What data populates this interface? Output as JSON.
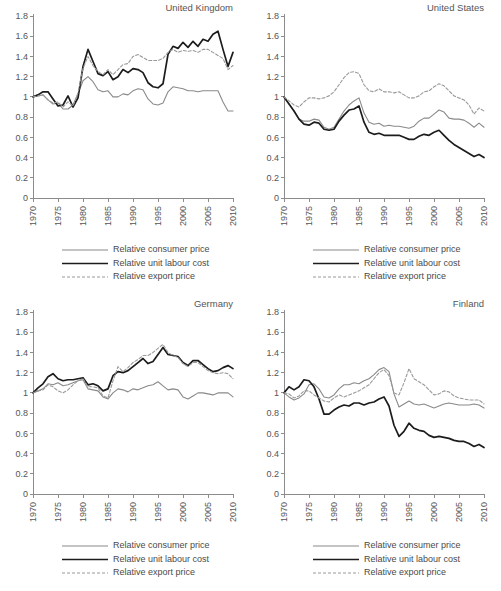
{
  "figure": {
    "panel_titles": [
      "United Kingdom",
      "United States",
      "Germany",
      "Finland"
    ]
  },
  "legend": {
    "items": [
      {
        "label": "Relative consumer price",
        "key": "consumer_price",
        "style": "solid",
        "color": "#8a8a8a",
        "width": 1.1
      },
      {
        "label": "Relative unit labour cost",
        "key": "unit_labour_cost",
        "style": "solid",
        "color": "#1c1c1c",
        "width": 1.7
      },
      {
        "label": "Relative export price",
        "key": "export_price",
        "style": "dashed",
        "color": "#9a9a9a",
        "width": 1.1
      }
    ]
  },
  "axes": {
    "ytick_labels": [
      "1.8",
      "1.6",
      "1.4",
      "1.2",
      "1",
      "0.8",
      "0.6",
      "0.4",
      "0.2",
      "0"
    ],
    "ytick_values": [
      1.8,
      1.6,
      1.4,
      1.2,
      1.0,
      0.8,
      0.6,
      0.4,
      0.2,
      0
    ],
    "xtick_labels": [
      "1970",
      "1975",
      "1980",
      "1985",
      "1990",
      "1995",
      "2000",
      "2005",
      "2010"
    ],
    "xtick_values": [
      1970,
      1975,
      1980,
      1985,
      1990,
      1995,
      2000,
      2005,
      2010
    ],
    "ylim": [
      0,
      1.8
    ],
    "xlim": [
      1970,
      2010
    ],
    "grid": false
  },
  "chart_data": [
    {
      "type": "line",
      "title": "United Kingdom",
      "xlabel": "",
      "ylabel": "",
      "xlim": [
        1970,
        2010
      ],
      "ylim": [
        0,
        1.8
      ],
      "grid": false,
      "legend_position": "below",
      "x": [
        1970,
        1971,
        1972,
        1973,
        1974,
        1975,
        1976,
        1977,
        1978,
        1979,
        1980,
        1981,
        1982,
        1983,
        1984,
        1985,
        1986,
        1987,
        1988,
        1989,
        1990,
        1991,
        1992,
        1993,
        1994,
        1995,
        1996,
        1997,
        1998,
        1999,
        2000,
        2001,
        2002,
        2003,
        2004,
        2005,
        2006,
        2007,
        2008,
        2009,
        2010
      ],
      "series": [
        {
          "name": "Relative consumer price",
          "key": "consumer_price",
          "values": [
            1.0,
            1.01,
            1.02,
            0.97,
            0.93,
            0.94,
            0.88,
            0.88,
            0.92,
            1.03,
            1.16,
            1.2,
            1.15,
            1.07,
            1.05,
            1.06,
            1.0,
            1.0,
            1.03,
            1.02,
            1.06,
            1.08,
            1.07,
            0.98,
            0.93,
            0.92,
            0.94,
            1.05,
            1.1,
            1.09,
            1.08,
            1.06,
            1.06,
            1.05,
            1.06,
            1.06,
            1.06,
            1.06,
            0.95,
            0.86,
            0.86
          ]
        },
        {
          "name": "Relative unit labour cost",
          "key": "unit_labour_cost",
          "values": [
            1.0,
            1.02,
            1.05,
            1.05,
            0.98,
            0.91,
            0.92,
            1.01,
            0.9,
            0.99,
            1.3,
            1.47,
            1.35,
            1.23,
            1.21,
            1.25,
            1.17,
            1.2,
            1.27,
            1.24,
            1.28,
            1.27,
            1.24,
            1.14,
            1.1,
            1.09,
            1.13,
            1.42,
            1.5,
            1.48,
            1.54,
            1.49,
            1.55,
            1.5,
            1.57,
            1.55,
            1.62,
            1.65,
            1.47,
            1.3,
            1.44
          ]
        },
        {
          "name": "Relative export price",
          "key": "export_price",
          "values": [
            1.0,
            1.01,
            1.02,
            0.97,
            0.94,
            0.95,
            0.9,
            0.95,
            0.91,
            1.04,
            1.28,
            1.4,
            1.31,
            1.25,
            1.22,
            1.27,
            1.22,
            1.27,
            1.32,
            1.33,
            1.4,
            1.42,
            1.39,
            1.36,
            1.36,
            1.36,
            1.38,
            1.44,
            1.47,
            1.44,
            1.46,
            1.45,
            1.46,
            1.44,
            1.47,
            1.47,
            1.44,
            1.41,
            1.38,
            1.27,
            1.31
          ]
        }
      ]
    },
    {
      "type": "line",
      "title": "United States",
      "xlabel": "",
      "ylabel": "",
      "xlim": [
        1970,
        2010
      ],
      "ylim": [
        0,
        1.8
      ],
      "grid": false,
      "legend_position": "below",
      "x": [
        1970,
        1971,
        1972,
        1973,
        1974,
        1975,
        1976,
        1977,
        1978,
        1979,
        1980,
        1981,
        1982,
        1983,
        1984,
        1985,
        1986,
        1987,
        1988,
        1989,
        1990,
        1991,
        1992,
        1993,
        1994,
        1995,
        1996,
        1997,
        1998,
        1999,
        2000,
        2001,
        2002,
        2003,
        2004,
        2005,
        2006,
        2007,
        2008,
        2009,
        2010
      ],
      "series": [
        {
          "name": "Relative consumer price",
          "key": "consumer_price",
          "values": [
            1.0,
            0.93,
            0.86,
            0.78,
            0.76,
            0.76,
            0.78,
            0.77,
            0.7,
            0.68,
            0.7,
            0.78,
            0.86,
            0.92,
            0.96,
            0.99,
            0.84,
            0.75,
            0.73,
            0.74,
            0.71,
            0.72,
            0.71,
            0.71,
            0.7,
            0.69,
            0.71,
            0.76,
            0.79,
            0.79,
            0.83,
            0.87,
            0.85,
            0.79,
            0.78,
            0.78,
            0.77,
            0.74,
            0.7,
            0.74,
            0.7
          ]
        },
        {
          "name": "Relative unit labour cost",
          "key": "unit_labour_cost",
          "values": [
            1.0,
            0.93,
            0.86,
            0.78,
            0.73,
            0.72,
            0.75,
            0.74,
            0.68,
            0.67,
            0.68,
            0.76,
            0.82,
            0.87,
            0.88,
            0.91,
            0.75,
            0.65,
            0.63,
            0.64,
            0.62,
            0.62,
            0.62,
            0.62,
            0.6,
            0.58,
            0.58,
            0.61,
            0.63,
            0.62,
            0.65,
            0.67,
            0.62,
            0.57,
            0.53,
            0.5,
            0.47,
            0.44,
            0.41,
            0.43,
            0.4
          ]
        },
        {
          "name": "Relative export price",
          "key": "export_price",
          "values": [
            1.0,
            0.96,
            0.92,
            0.9,
            0.95,
            0.99,
            0.99,
            0.98,
            0.99,
            1.01,
            1.05,
            1.12,
            1.19,
            1.24,
            1.25,
            1.23,
            1.12,
            1.06,
            1.05,
            1.08,
            1.05,
            1.05,
            1.04,
            1.05,
            1.02,
            0.99,
            0.99,
            1.01,
            1.05,
            1.06,
            1.1,
            1.13,
            1.11,
            1.06,
            1.01,
            0.99,
            0.97,
            0.92,
            0.83,
            0.89,
            0.86
          ]
        }
      ]
    },
    {
      "type": "line",
      "title": "Germany",
      "xlabel": "",
      "ylabel": "",
      "xlim": [
        1970,
        2010
      ],
      "ylim": [
        0,
        1.8
      ],
      "grid": false,
      "legend_position": "below",
      "x": [
        1970,
        1971,
        1972,
        1973,
        1974,
        1975,
        1976,
        1977,
        1978,
        1979,
        1980,
        1981,
        1982,
        1983,
        1984,
        1985,
        1986,
        1987,
        1988,
        1989,
        1990,
        1991,
        1992,
        1993,
        1994,
        1995,
        1996,
        1997,
        1998,
        1999,
        2000,
        2001,
        2002,
        2003,
        2004,
        2005,
        2006,
        2007,
        2008,
        2009,
        2010
      ],
      "series": [
        {
          "name": "Relative consumer price",
          "key": "consumer_price",
          "values": [
            1.0,
            1.02,
            1.04,
            1.09,
            1.08,
            1.1,
            1.07,
            1.08,
            1.1,
            1.12,
            1.13,
            1.04,
            1.03,
            1.02,
            0.96,
            0.94,
            1.0,
            1.04,
            1.03,
            1.01,
            1.04,
            1.03,
            1.05,
            1.07,
            1.08,
            1.11,
            1.07,
            1.03,
            1.04,
            1.03,
            0.96,
            0.94,
            0.97,
            1.0,
            1.0,
            0.99,
            0.98,
            1.0,
            1.0,
            1.0,
            0.96
          ]
        },
        {
          "name": "Relative unit labour cost",
          "key": "unit_labour_cost",
          "values": [
            1.0,
            1.05,
            1.09,
            1.16,
            1.19,
            1.14,
            1.12,
            1.13,
            1.13,
            1.14,
            1.15,
            1.08,
            1.09,
            1.07,
            1.02,
            1.04,
            1.17,
            1.21,
            1.2,
            1.22,
            1.26,
            1.3,
            1.34,
            1.29,
            1.31,
            1.38,
            1.45,
            1.38,
            1.37,
            1.36,
            1.3,
            1.27,
            1.32,
            1.32,
            1.28,
            1.24,
            1.21,
            1.22,
            1.25,
            1.27,
            1.24
          ]
        },
        {
          "name": "Relative export price",
          "key": "export_price",
          "values": [
            1.0,
            1.02,
            1.03,
            1.08,
            1.06,
            1.02,
            1.0,
            1.03,
            1.08,
            1.12,
            1.14,
            1.06,
            1.06,
            1.05,
            0.97,
            0.95,
            1.12,
            1.26,
            1.21,
            1.25,
            1.3,
            1.33,
            1.37,
            1.37,
            1.4,
            1.44,
            1.48,
            1.4,
            1.37,
            1.35,
            1.29,
            1.26,
            1.3,
            1.3,
            1.26,
            1.22,
            1.2,
            1.19,
            1.2,
            1.19,
            1.14
          ]
        }
      ]
    },
    {
      "type": "line",
      "title": "Finland",
      "xlabel": "",
      "ylabel": "",
      "xlim": [
        1970,
        2010
      ],
      "ylim": [
        0,
        1.8
      ],
      "grid": false,
      "legend_position": "below",
      "x": [
        1970,
        1971,
        1972,
        1973,
        1974,
        1975,
        1976,
        1977,
        1978,
        1979,
        1980,
        1981,
        1982,
        1983,
        1984,
        1985,
        1986,
        1987,
        1988,
        1989,
        1990,
        1991,
        1992,
        1993,
        1994,
        1995,
        1996,
        1997,
        1998,
        1999,
        2000,
        2001,
        2002,
        2003,
        2004,
        2005,
        2006,
        2007,
        2008,
        2009,
        2010
      ],
      "series": [
        {
          "name": "Relative consumer price",
          "key": "consumer_price",
          "values": [
            1.0,
            0.96,
            0.93,
            0.95,
            0.99,
            1.08,
            1.09,
            1.04,
            0.96,
            0.95,
            0.98,
            1.04,
            1.08,
            1.08,
            1.1,
            1.09,
            1.12,
            1.14,
            1.18,
            1.23,
            1.25,
            1.21,
            0.99,
            0.86,
            0.89,
            0.92,
            0.89,
            0.88,
            0.89,
            0.87,
            0.85,
            0.87,
            0.89,
            0.9,
            0.89,
            0.88,
            0.88,
            0.88,
            0.89,
            0.88,
            0.85
          ]
        },
        {
          "name": "Relative unit labour cost",
          "key": "unit_labour_cost",
          "values": [
            1.0,
            1.06,
            1.03,
            1.06,
            1.13,
            1.12,
            1.06,
            0.94,
            0.79,
            0.79,
            0.83,
            0.86,
            0.88,
            0.87,
            0.9,
            0.9,
            0.88,
            0.9,
            0.91,
            0.94,
            0.96,
            0.87,
            0.68,
            0.57,
            0.62,
            0.7,
            0.65,
            0.63,
            0.62,
            0.58,
            0.56,
            0.57,
            0.56,
            0.55,
            0.53,
            0.52,
            0.52,
            0.5,
            0.47,
            0.49,
            0.46
          ]
        },
        {
          "name": "Relative export price",
          "key": "export_price",
          "values": [
            1.0,
            0.99,
            0.95,
            0.97,
            1.02,
            1.02,
            0.98,
            0.95,
            0.92,
            0.91,
            0.95,
            0.98,
            0.96,
            0.98,
            1.0,
            1.02,
            1.05,
            1.08,
            1.14,
            1.2,
            1.23,
            1.17,
            1.0,
            0.98,
            1.1,
            1.24,
            1.14,
            1.11,
            1.08,
            1.03,
            0.98,
            0.99,
            1.02,
            1.01,
            0.97,
            0.95,
            0.94,
            0.93,
            0.93,
            0.93,
            0.89
          ]
        }
      ]
    }
  ]
}
